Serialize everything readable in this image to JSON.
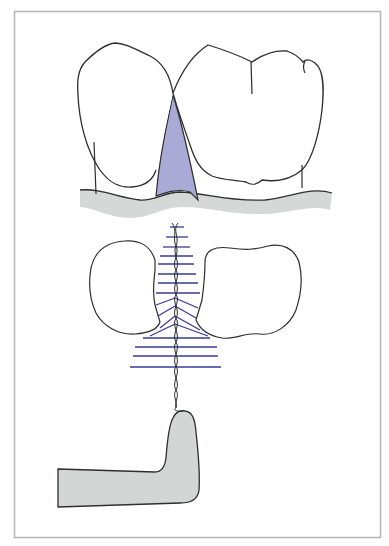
{
  "figure": {
    "colors": {
      "background": "#ffffff",
      "frame": "#b4b4b4",
      "outline": "#2e2e2e",
      "gingiva_fill": "#d6d8d8",
      "interdental_fill": "#a9aad6",
      "floss_lines": "#3a3a9a",
      "holder_fill": "#d4d6d6"
    },
    "panels": [
      {
        "name": "buccal-view",
        "label": "Two molars with interdental gap (shaded) above gingiva"
      },
      {
        "name": "occlusal-view",
        "label": "Cross-section of teeth with floss strands fanned through contact"
      },
      {
        "name": "holder-view",
        "label": "Floss holder handle with twisted floss"
      }
    ]
  }
}
